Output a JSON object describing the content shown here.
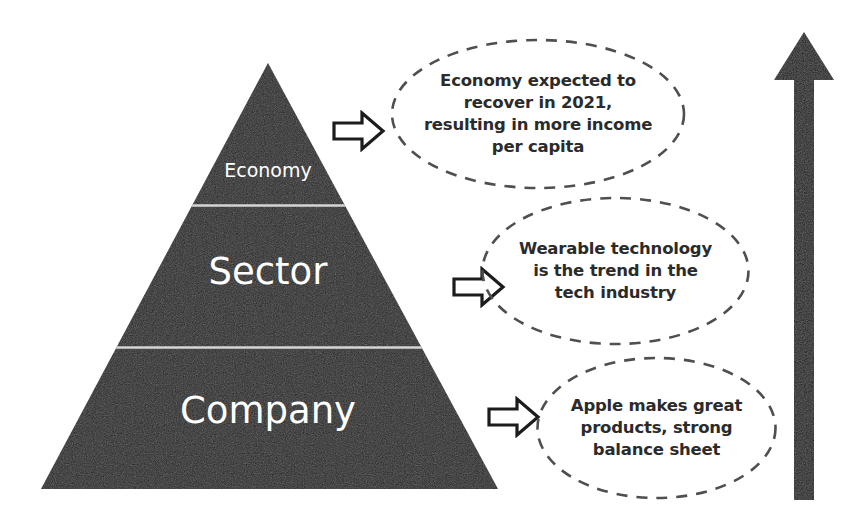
{
  "diagram": {
    "background_color": "#ffffff",
    "pyramid": {
      "fill_color": "#1a1a1a",
      "divider_color": "#d8d8d8",
      "label_color": "#ffffff",
      "tiers": [
        {
          "label": "Economy",
          "position": "top"
        },
        {
          "label": "Sector",
          "position": "middle"
        },
        {
          "label": "Company",
          "position": "bottom"
        }
      ]
    },
    "connector_arrows": [
      {
        "icon": "right-block-arrow",
        "points_to": "Economy"
      },
      {
        "icon": "right-block-arrow",
        "points_to": "Sector"
      },
      {
        "icon": "right-block-arrow",
        "points_to": "Company"
      }
    ],
    "callouts": [
      {
        "id": "economy-callout",
        "text": "Economy expected to recover in 2021, resulting in more income per capita",
        "border_style": "dashed",
        "border_color": "#555555",
        "text_color": "#2b2b2b"
      },
      {
        "id": "sector-callout",
        "text": "Wearable technology is the trend in the tech industry",
        "border_style": "dashed",
        "border_color": "#555555",
        "text_color": "#2b2b2b"
      },
      {
        "id": "company-callout",
        "text": "Apple makes great products, strong balance sheet",
        "border_style": "dashed",
        "border_color": "#555555",
        "text_color": "#2b2b2b"
      }
    ],
    "direction_arrow": {
      "icon": "up-arrow",
      "orientation": "up",
      "color": "#111111"
    }
  }
}
